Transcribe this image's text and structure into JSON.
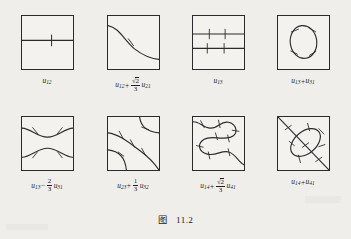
{
  "figure": {
    "caption_cjk": "图",
    "caption_number": "11.2",
    "type": "mathematical-diagram-grid",
    "rows": 2,
    "columns": 4
  },
  "panels": [
    {
      "id": "panel-1",
      "position": {
        "row": 1,
        "col": 1
      },
      "label_plain": "u12",
      "label_parts": {
        "term1_var": "u",
        "term1_sub": "12"
      },
      "curves": [
        {
          "kind": "horizontal-line",
          "y_fraction": 0.46,
          "ticks": 1
        }
      ],
      "tick_count": 1
    },
    {
      "id": "panel-2",
      "position": {
        "row": 1,
        "col": 2
      },
      "label_plain": "u12 + (sqrt2/3) u21",
      "label_parts": {
        "term1_var": "u",
        "term1_sub": "12",
        "operator": "+",
        "frac_numerator": "2",
        "frac_numerator_radical": "√",
        "frac_denominator": "3",
        "term2_var": "u",
        "term2_sub": "21"
      },
      "curves": [
        {
          "kind": "descending-s-curve",
          "from": "left-upper",
          "to": "right-lower",
          "ticks": 1
        }
      ],
      "tick_count": 1
    },
    {
      "id": "panel-3",
      "position": {
        "row": 1,
        "col": 3
      },
      "label_plain": "u13",
      "label_parts": {
        "term1_var": "u",
        "term1_sub": "13"
      },
      "curves": [
        {
          "kind": "horizontal-line",
          "y_fraction": 0.34,
          "ticks": 2
        },
        {
          "kind": "horizontal-line",
          "y_fraction": 0.6,
          "ticks": 2
        }
      ],
      "tick_count": 4
    },
    {
      "id": "panel-4",
      "position": {
        "row": 1,
        "col": 4
      },
      "label_plain": "u13 + u31",
      "label_parts": {
        "term1_var": "u",
        "term1_sub": "13",
        "operator": "+",
        "term2_var": "u",
        "term2_sub": "31"
      },
      "curves": [
        {
          "kind": "closed-oval",
          "ticks": 4
        }
      ],
      "tick_count": 4
    },
    {
      "id": "panel-5",
      "position": {
        "row": 2,
        "col": 1
      },
      "label_plain": "u13 - (2/3) u31",
      "label_parts": {
        "term1_var": "u",
        "term1_sub": "13",
        "operator": "−",
        "frac_numerator": "2",
        "frac_denominator": "3",
        "term2_var": "u",
        "term2_sub": "31"
      },
      "curves": [
        {
          "kind": "arc-dipping-down",
          "ticks": 2
        },
        {
          "kind": "arc-bulging-up",
          "ticks": 2
        }
      ],
      "tick_count": 4
    },
    {
      "id": "panel-6",
      "position": {
        "row": 2,
        "col": 2
      },
      "label_plain": "u23 + (1/3) u32",
      "label_parts": {
        "term1_var": "u",
        "term1_sub": "23",
        "operator": "+",
        "frac_numerator": "1",
        "frac_denominator": "3",
        "term2_var": "u",
        "term2_sub": "32"
      },
      "curves": [
        {
          "kind": "long-diagonal-curve",
          "ticks": 3
        },
        {
          "kind": "corner-arc-top-right",
          "ticks": 1
        },
        {
          "kind": "corner-arc-bottom-left",
          "ticks": 1
        }
      ],
      "tick_count": 5
    },
    {
      "id": "panel-7",
      "position": {
        "row": 2,
        "col": 3
      },
      "label_plain": "u14 + (sqrt2/3) u41",
      "label_parts": {
        "term1_var": "u",
        "term1_sub": "14",
        "operator": "+",
        "frac_numerator": "2",
        "frac_numerator_radical": "√",
        "frac_denominator": "3",
        "term2_var": "u",
        "term2_sub": "41"
      },
      "curves": [
        {
          "kind": "serpentine-double-loop",
          "ticks": 6
        }
      ],
      "tick_count": 6
    },
    {
      "id": "panel-8",
      "position": {
        "row": 2,
        "col": 4
      },
      "label_plain": "u14 + u41",
      "label_parts": {
        "term1_var": "u",
        "term1_sub": "14",
        "operator": "+",
        "term2_var": "u",
        "term2_sub": "41"
      },
      "curves": [
        {
          "kind": "main-diagonal-line",
          "from": "top-left-corner",
          "to": "bottom-right-corner",
          "ticks": 3
        },
        {
          "kind": "tilted-lens-oval",
          "ticks": 5
        }
      ],
      "tick_count": 8
    }
  ],
  "colors": {
    "page_background": "#efeeea",
    "panel_background": "#f3f2ee",
    "ink": "#2b2b2b",
    "label_text": "#1d1d1d"
  }
}
